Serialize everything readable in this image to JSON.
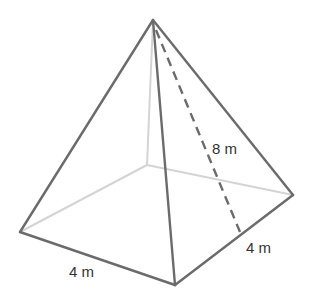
{
  "diagram": {
    "type": "square-pyramid",
    "colors": {
      "visible_edge": "#6b6b6b",
      "hidden_edge": "#d4d4d4",
      "slant_height": "#6b6b6b",
      "label": "#333333",
      "background": "#ffffff"
    },
    "vertices": {
      "apex": [
        153,
        20
      ],
      "left": [
        20,
        232
      ],
      "front": [
        175,
        285
      ],
      "right": [
        293,
        195
      ],
      "back": [
        147,
        165
      ],
      "slant_foot": [
        240,
        232
      ]
    },
    "labels": {
      "slant_height": "8 m",
      "right_base_edge": "4 m",
      "left_base_edge": "4 m"
    }
  }
}
